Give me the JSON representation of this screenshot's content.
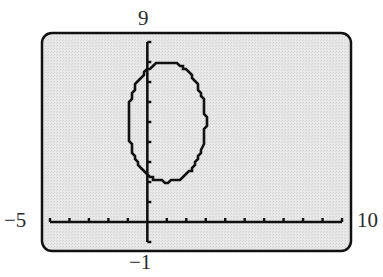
{
  "chart_data": {
    "type": "line",
    "title": "",
    "xlabel": "",
    "ylabel": "",
    "window": {
      "xmin": -5,
      "xmax": 10,
      "xscl": 1,
      "ymin": -1,
      "ymax": 9,
      "yscl": 1
    },
    "tick_labels": {
      "xmin": "−5",
      "xmax": "10",
      "ymin": "−1",
      "ymax": "9"
    },
    "grid": false,
    "legend": null,
    "series": [
      {
        "name": "ellipse",
        "equation": "(x-1)^2/4 + (y-5)^2/9 = 1",
        "center": [
          1,
          5
        ],
        "semi_axis_x": 2,
        "semi_axis_y": 3,
        "x_range": [
          -1,
          3
        ],
        "y_range": [
          2,
          8
        ]
      }
    ]
  },
  "style": {
    "screen_bg": "#e4e4e4",
    "frame_color": "#111111",
    "axis_color": "#111111",
    "curve_color": "#111111",
    "page_bg": "#ffffff"
  },
  "layout": {
    "frame": {
      "x": 42,
      "y": 33,
      "w": 309,
      "h": 218,
      "r": 10
    },
    "plot_px": {
      "x0": 50,
      "x1": 342,
      "y0": 42,
      "y1": 242
    }
  }
}
